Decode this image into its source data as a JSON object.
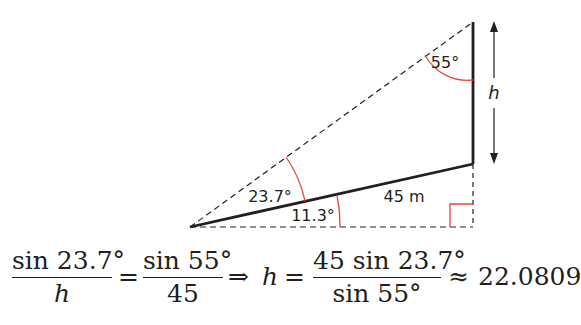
{
  "diagram": {
    "angles": {
      "top": "55°",
      "left_upper": "23.7°",
      "left_lower": "11.3°"
    },
    "side_label": "45 m",
    "height_label": "h",
    "colors": {
      "line": "#231f20",
      "angle_arc": "#e8473f"
    }
  },
  "equation": {
    "frac1_num": "sin 23.7°",
    "frac1_den": "h",
    "eq1": "=",
    "frac2_num": "sin 55°",
    "frac2_den": "45",
    "implies": "⇒",
    "h_var": "h",
    "eq2": "=",
    "frac3_num": "45 sin 23.7°",
    "frac3_den": "sin 55°",
    "approx": "≈",
    "result": "22.0809"
  }
}
